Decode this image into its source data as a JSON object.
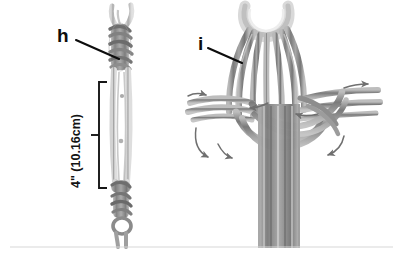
{
  "figure": {
    "kind": "knot-tying-instruction-diagram",
    "background_color": "#ffffff",
    "ink_color": "#0d0d0d",
    "cord_color_dark": "#7d7d7d",
    "cord_color_mid": "#9b9b9b",
    "cord_color_light": "#c2c2c2",
    "baseline_rule_color": "#d8d8d8"
  },
  "callouts": [
    {
      "id": "h",
      "label": "h",
      "description": "left panel step label",
      "leader_from_x": 76,
      "leader_from_y": 40,
      "leader_to_x": 119,
      "leader_to_y": 59
    },
    {
      "id": "i",
      "label": "i",
      "description": "right panel step label",
      "leader_from_x": 208,
      "leader_from_y": 48,
      "leader_to_x": 242,
      "leader_to_y": 63
    }
  ],
  "dimensions": [
    {
      "id": "left-loop-length",
      "text": "4\" (10.16cm)",
      "value_inches": 4,
      "value_cm": 10.16,
      "bracket_top_y": 82,
      "bracket_bottom_y": 188,
      "bracket_x": 99,
      "orientation": "vertical"
    }
  ],
  "panels": [
    {
      "id": "panel-h",
      "label": "h",
      "content": "cord with top loop, wrapped barrel knot, long doubled loop, and lower stacked knots"
    },
    {
      "id": "panel-i",
      "label": "i",
      "content": "bundled cord loop with woven crossing knot and directional arrows"
    }
  ],
  "arrows": [
    {
      "id": "arrow-left-upper",
      "direction": "right",
      "x": 200,
      "y": 95
    },
    {
      "id": "arrow-left-lower-a",
      "direction": "down-right",
      "x": 205,
      "y": 150
    },
    {
      "id": "arrow-left-lower-b",
      "direction": "down-right",
      "x": 228,
      "y": 153
    },
    {
      "id": "arrow-mid",
      "direction": "left",
      "x": 252,
      "y": 108
    },
    {
      "id": "arrow-right-upper",
      "direction": "right",
      "x": 360,
      "y": 85
    },
    {
      "id": "arrow-right-mid",
      "direction": "left",
      "x": 300,
      "y": 112
    },
    {
      "id": "arrow-right-lower",
      "direction": "down-left",
      "x": 330,
      "y": 152
    }
  ]
}
